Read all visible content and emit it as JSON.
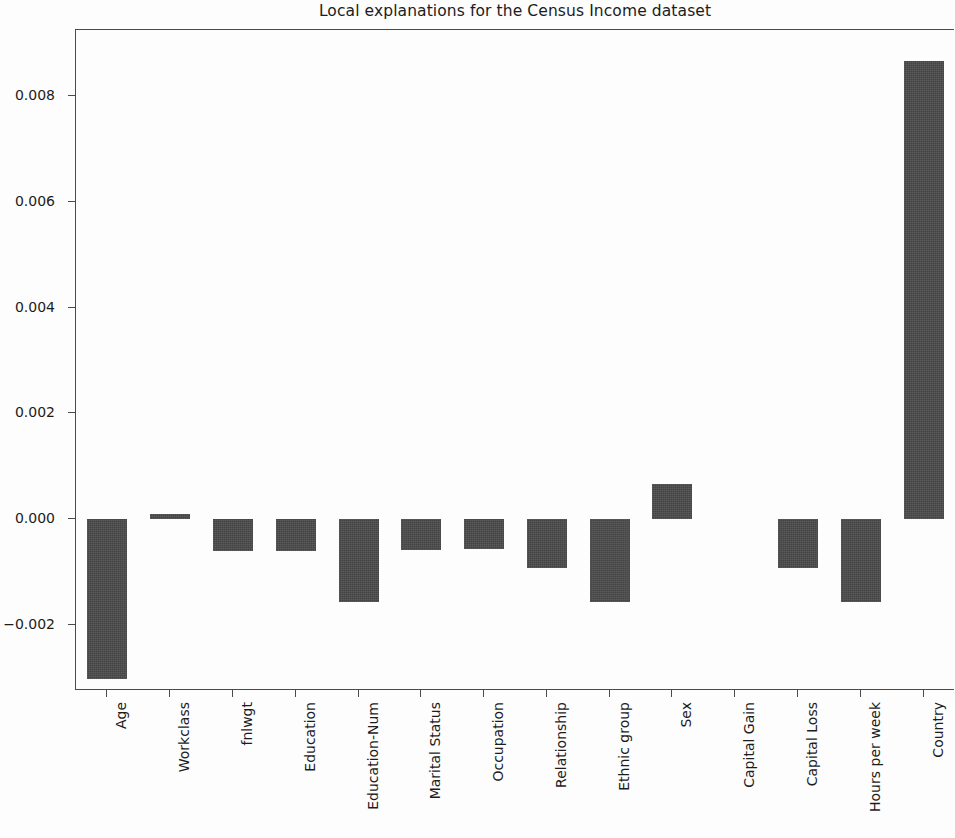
{
  "chart_data": {
    "type": "bar",
    "title": "Local explanations for the Census Income dataset",
    "xlabel": "",
    "ylabel": "",
    "grid": false,
    "legend": null,
    "bar_color": "#4b4b4b",
    "background_color": "#ffffff",
    "ylim": [
      -0.00325,
      0.00925
    ],
    "ytick_values": [
      0.008,
      0.006,
      0.004,
      0.002,
      0.0,
      -0.002
    ],
    "ytick_labels": [
      "0.008",
      "0.006",
      "0.004",
      "0.002",
      "0.000",
      "−0.002"
    ],
    "categories": [
      "Age",
      "Workclass",
      "fnlwgt",
      "Education",
      "Education-Num",
      "Marital Status",
      "Occupation",
      "Relationship",
      "Ethnic group",
      "Sex",
      "Capital Gain",
      "Capital Loss",
      "Hours per week",
      "Country"
    ],
    "values": [
      -0.00302,
      9e-05,
      -0.00061,
      -0.00061,
      -0.00156,
      -0.00059,
      -0.00057,
      -0.00093,
      -0.00156,
      0.00067,
      0.0,
      -0.00093,
      -0.00156,
      0.00867
    ]
  },
  "figure": {
    "title": "Local explanations for the Census Income dataset"
  }
}
